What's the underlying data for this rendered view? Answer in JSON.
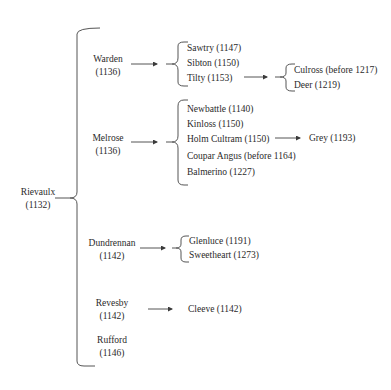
{
  "root": {
    "name": "Rievaulx",
    "year": "(1132)"
  },
  "daughters": [
    {
      "name": "Warden",
      "year": "(1136)"
    },
    {
      "name": "Melrose",
      "year": "(1136)"
    },
    {
      "name": "Dundrennan",
      "year": "(1142)"
    },
    {
      "name": "Revesby",
      "year": "(1142)"
    },
    {
      "name": "Rufford",
      "year": "(1146)"
    }
  ],
  "warden_children": [
    "Sawtry (1147)",
    "Sibton (1150)",
    "Tilty (1153)"
  ],
  "tilty_children": [
    "Culross (before 1217)",
    "Deer (1219)"
  ],
  "melrose_children": [
    "Newbattle (1140)",
    "Kinloss (1150)",
    "Holm Cultram (1150)",
    "Coupar Angus (before 1164)",
    "Balmerino (1227)"
  ],
  "holm_cultram_children": [
    "Grey (1193)"
  ],
  "dundrennan_children": [
    "Glenluce (1191)",
    "Sweetheart (1273)"
  ],
  "revesby_children": [
    "Cleeve (1142)"
  ],
  "colors": {
    "ink": "#2a2a2a",
    "line": "#4a4a4a",
    "background": "#ffffff"
  }
}
